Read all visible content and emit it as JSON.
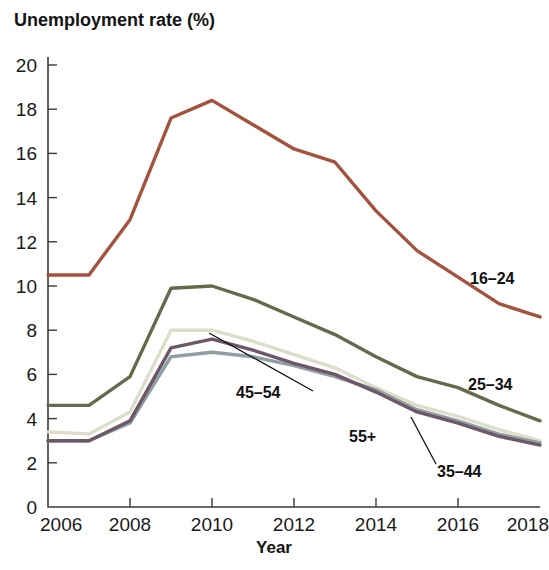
{
  "chart_data": {
    "type": "line",
    "title": "Unemployment rate (%)",
    "xlabel": "Year",
    "ylabel": "Unemployment rate (%)",
    "x": [
      2006,
      2007,
      2008,
      2009,
      2010,
      2011,
      2012,
      2013,
      2014,
      2015,
      2016,
      2017,
      2018
    ],
    "xlim": [
      2006,
      2018
    ],
    "ylim": [
      0,
      20
    ],
    "xticks": [
      2006,
      2008,
      2010,
      2012,
      2014,
      2016,
      2018
    ],
    "xtick_labels": [
      "2006",
      "2008",
      "2010",
      "2012",
      "2014",
      "2016",
      "2018"
    ],
    "yticks": [
      0,
      2,
      4,
      6,
      8,
      10,
      12,
      14,
      16,
      18,
      20
    ],
    "ytick_labels": [
      "0",
      "2",
      "4",
      "6",
      "8",
      "10",
      "12",
      "14",
      "16",
      "18",
      "20"
    ],
    "grid": false,
    "legend": "inline-labels",
    "series": [
      {
        "name": "16-24",
        "label": "16–24",
        "color": "#a3523d",
        "values": [
          10.5,
          10.5,
          13.0,
          17.6,
          18.4,
          17.3,
          16.2,
          15.6,
          13.4,
          11.6,
          10.4,
          9.2,
          8.6
        ]
      },
      {
        "name": "25-34",
        "label": "25–34",
        "color": "#636b4b",
        "values": [
          4.6,
          4.6,
          5.9,
          9.9,
          10.0,
          9.4,
          8.6,
          7.8,
          6.8,
          5.9,
          5.4,
          4.6,
          3.9
        ]
      },
      {
        "name": "35-44",
        "label": "35–44",
        "color": "#ddddc9",
        "values": [
          3.4,
          3.3,
          4.3,
          8.0,
          8.0,
          7.5,
          6.9,
          6.3,
          5.4,
          4.6,
          4.1,
          3.5,
          3.0
        ]
      },
      {
        "name": "45-54",
        "label": "45–54",
        "color": "#6e5767",
        "values": [
          3.0,
          3.0,
          3.9,
          7.2,
          7.6,
          7.1,
          6.5,
          6.0,
          5.2,
          4.3,
          3.8,
          3.2,
          2.8
        ]
      },
      {
        "name": "55+",
        "label": "55+",
        "color": "#8fa0a3",
        "values": [
          3.0,
          3.0,
          3.8,
          6.8,
          7.0,
          6.8,
          6.4,
          5.9,
          5.3,
          4.4,
          3.9,
          3.3,
          2.9
        ]
      }
    ],
    "annotations": [
      {
        "name": "16-24",
        "text": "16–24",
        "x": 470,
        "y": 284,
        "anchor": "start",
        "leader": null
      },
      {
        "name": "25-34",
        "text": "25–34",
        "x": 468,
        "y": 390,
        "anchor": "start",
        "leader": null
      },
      {
        "name": "45-54",
        "text": "45–54",
        "x": 236,
        "y": 398,
        "anchor": "start",
        "leader": [
          313,
          391,
          209,
          333
        ]
      },
      {
        "name": "55+",
        "text": "55+",
        "x": 349,
        "y": 442,
        "anchor": "start",
        "leader": null
      },
      {
        "name": "35-44",
        "text": "35–44",
        "x": 437,
        "y": 477,
        "anchor": "start",
        "leader": [
          436,
          464,
          411,
          417
        ]
      }
    ]
  }
}
